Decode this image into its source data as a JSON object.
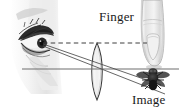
{
  "figure": {
    "kind": "optics-ray-diagram",
    "title_visible": false,
    "background_color": "#ffffff",
    "width": 181,
    "height": 111
  },
  "labels": {
    "finger": "Finger",
    "image": "Image"
  },
  "colors": {
    "ink": "#1a1a1a",
    "axis": "#6e6e6e",
    "ray": "#4a4a4a",
    "dashed": "#4a4a4a",
    "lens_outline": "#3a3a3a",
    "lens_fill": "#f2f2f2",
    "sketch_dark": "#2b2b2b",
    "sketch_mid": "#8c8c8c",
    "sketch_light": "#cfcfcf",
    "finger_fill": "#e8e8e8",
    "fly_body": "#1e1e1e"
  },
  "objects": {
    "eye": {
      "name": "eye",
      "x": 42,
      "y": 43,
      "description": "pencil sketch of an eye in profile with lashes"
    },
    "finger": {
      "name": "finger",
      "x": 152,
      "y_top": 0,
      "y_tip": 66,
      "description": "vertical finger pointing downward to the optical axis"
    },
    "lens": {
      "name": "converging-lens",
      "center_x": 97,
      "top_y": 43,
      "bottom_y": 100,
      "type": "biconvex"
    },
    "fly": {
      "name": "fly-image",
      "x": 152,
      "y": 80,
      "description": "inverted image of a fly below the optical axis"
    }
  },
  "lines": {
    "optical_axis": {
      "name": "optical-axis",
      "x1": 22,
      "y1": 69,
      "x2": 178,
      "y2": 69,
      "style": "solid"
    },
    "sight_line_dashed": {
      "name": "line-of-sight-to-finger",
      "x1": 43,
      "y1": 43,
      "x2": 146,
      "y2": 43,
      "style": "dashed"
    },
    "ray_upper": {
      "name": "ray-eye-to-fly-upper",
      "x1": 43,
      "y1": 44,
      "x2": 160,
      "y2": 84,
      "style": "solid"
    },
    "ray_lower": {
      "name": "ray-eye-to-fly-lower",
      "x1": 43,
      "y1": 46,
      "x2": 163,
      "y2": 92,
      "style": "solid"
    }
  }
}
